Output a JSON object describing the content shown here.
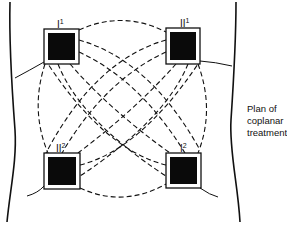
{
  "caption": {
    "lines": [
      "Plan of",
      "coplanar",
      "treatment"
    ]
  },
  "fields": [
    {
      "id": "I1",
      "base": "I",
      "sup": "1",
      "position": "top-left"
    },
    {
      "id": "II1",
      "base": "II",
      "sup": "1",
      "position": "top-right"
    },
    {
      "id": "II2",
      "base": "II",
      "sup": "2",
      "position": "bottom-left"
    },
    {
      "id": "I2",
      "base": "I",
      "sup": "2",
      "position": "bottom-right"
    }
  ],
  "colors": {
    "ink": "#111111",
    "background": "#ffffff"
  }
}
